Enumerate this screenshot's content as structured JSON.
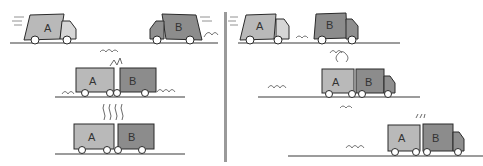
{
  "figure": {
    "colors": {
      "truck_a_body": "#b9b9b9",
      "truck_b_body": "#8c8c8c",
      "cab_a": "#d6d6d6",
      "cab_b": "#8f8f8f",
      "outline": "#2a2a2a",
      "ground": "#3a3a3a",
      "divider": "#9a9a9a"
    },
    "left_panel": {
      "scenario": "head-on collision",
      "frames": [
        {
          "truck_a_label": "A",
          "truck_b_label": "B",
          "state": "approaching"
        },
        {
          "truck_a_label": "A",
          "truck_b_label": "B",
          "state": "impact"
        },
        {
          "truck_a_label": "A",
          "truck_b_label": "B",
          "state": "crushed"
        }
      ]
    },
    "right_panel": {
      "scenario": "rear-end collision",
      "frames": [
        {
          "truck_a_label": "A",
          "truck_b_label": "B",
          "state": "approaching"
        },
        {
          "truck_a_label": "A",
          "truck_b_label": "B",
          "state": "impact"
        },
        {
          "truck_a_label": "A",
          "truck_b_label": "B",
          "state": "pushed together"
        }
      ]
    }
  }
}
